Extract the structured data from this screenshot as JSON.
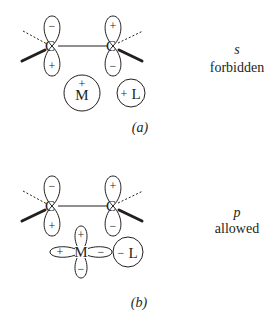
{
  "panels": [
    {
      "caption": "(a)",
      "atoms": {
        "left_carbon": "C",
        "right_carbon": "C",
        "metal": "M",
        "ligand": "L"
      },
      "left_carbon_lobes": {
        "top": "−",
        "bottom": "+"
      },
      "right_carbon_lobes": {
        "top": "+",
        "bottom": "−"
      },
      "metal_orbital": {
        "type": "s",
        "sign": "+"
      },
      "ligand_sign": "+",
      "symmetry_label": "s",
      "result": "forbidden"
    },
    {
      "caption": "(b)",
      "atoms": {
        "left_carbon": "C",
        "right_carbon": "C",
        "metal": "M",
        "ligand": "L"
      },
      "left_carbon_lobes": {
        "top": "−",
        "bottom": "+"
      },
      "right_carbon_lobes": {
        "top": "+",
        "bottom": "−"
      },
      "metal_orbital_lobes": {
        "top": "+",
        "bottom": "−",
        "left": "+",
        "right": "−"
      },
      "ligand_sign": "−",
      "symmetry_label": "p",
      "result": "allowed"
    }
  ]
}
